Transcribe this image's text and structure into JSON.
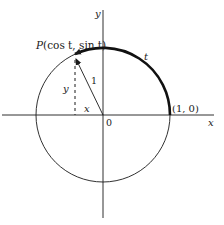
{
  "figure": {
    "type": "unit-circle",
    "labels": {
      "point_p": "P(cos t, sin t)",
      "point_p_prefix": "P",
      "point_p_args": "(cos t, sin t)",
      "arc": "t",
      "radius": "1",
      "opp_side": "y",
      "adj_side": "x",
      "origin": "0",
      "unit_point": "(1, 0)",
      "x_axis": "x",
      "y_axis": "y"
    },
    "colors": {
      "ink": "#1a1a1a",
      "background": "#ffffff"
    }
  }
}
